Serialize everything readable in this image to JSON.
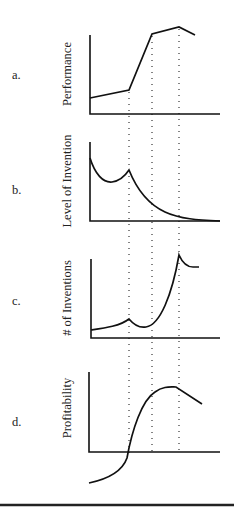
{
  "figure": {
    "panels": [
      {
        "id": "a",
        "label": "a.",
        "ylabel": "Performance"
      },
      {
        "id": "b",
        "label": "b.",
        "ylabel": "Level of Invention"
      },
      {
        "id": "c",
        "label": "c.",
        "ylabel": "# of Inventions"
      },
      {
        "id": "d",
        "label": "d.",
        "ylabel": "Profitability"
      }
    ],
    "guides": {
      "count": 3,
      "style": "dotted vertical",
      "span": "panels a–d"
    },
    "colors": {
      "ink": "#111111",
      "background": "#ffffff"
    }
  }
}
